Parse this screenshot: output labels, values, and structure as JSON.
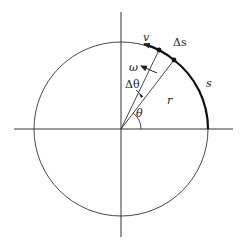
{
  "diagram": {
    "labels": {
      "v": "v",
      "delta_s": "Δs",
      "s": "s",
      "omega": "ω",
      "delta_theta": "Δθ",
      "r": "r",
      "theta": "θ"
    },
    "geometry": {
      "center": [
        121,
        129
      ],
      "radius": 87,
      "line_color": "#333333"
    }
  }
}
